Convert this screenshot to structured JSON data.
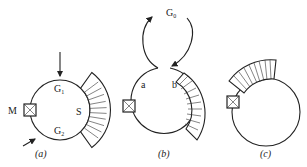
{
  "panels": [
    {
      "id": "a",
      "caption": "(a)",
      "labels": {
        "g1": "G",
        "g1_sub": "1",
        "g2": "G",
        "g2_sub": "2",
        "s": "S",
        "m": "M"
      }
    },
    {
      "id": "b",
      "caption": "(b)",
      "labels": {
        "g0": "G",
        "g0_sub": "0",
        "a": "a",
        "b": "b"
      }
    },
    {
      "id": "c",
      "caption": "(c)",
      "labels": {}
    }
  ],
  "colors": {
    "stroke": "#222222",
    "background": "#ffffff"
  }
}
